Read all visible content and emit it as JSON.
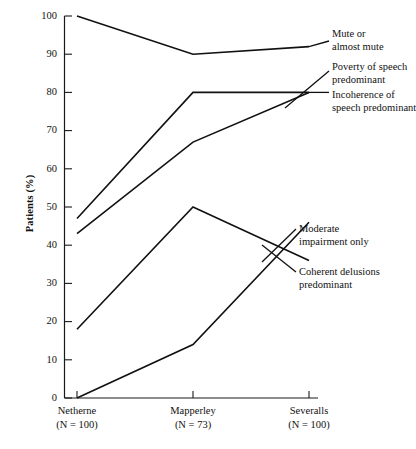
{
  "figure": {
    "y_axis_title": "Patients (%)",
    "y_ticks": [
      "0",
      "10",
      "20",
      "30",
      "40",
      "50",
      "60",
      "70",
      "80",
      "90",
      "100"
    ],
    "x_groups": [
      {
        "name": "Netherne",
        "n_text": "(N = 100)"
      },
      {
        "name": "Mapperley",
        "n_text": "(N = 73)"
      },
      {
        "name": "Severalls",
        "n_text": "(N = 100)"
      }
    ],
    "series_labels": [
      {
        "line1": "Mute or",
        "line2": "almost mute"
      },
      {
        "line1": "Poverty of speech",
        "line2": "predominant"
      },
      {
        "line1": "Incoherence of",
        "line2": "speech predominant"
      },
      {
        "line1": "Moderate",
        "line2": "impairment only"
      },
      {
        "line1": "Coherent delusions",
        "line2": "predominant"
      }
    ],
    "colors": {
      "line": "#111111",
      "axis": "#1a1a1a",
      "background": "#ffffff"
    }
  },
  "chart_data": {
    "type": "line",
    "title": "",
    "xlabel": "",
    "ylabel": "Patients (%)",
    "ylim": [
      0,
      100
    ],
    "yticks": [
      0,
      10,
      20,
      30,
      40,
      50,
      60,
      70,
      80,
      90,
      100
    ],
    "grid": false,
    "legend": "right-inline-labels",
    "categories": [
      "Netherne",
      "Mapperley",
      "Severalls"
    ],
    "category_n": [
      100,
      73,
      100
    ],
    "series": [
      {
        "name": "Mute or almost mute",
        "values": [
          100,
          90,
          92
        ]
      },
      {
        "name": "Poverty of speech predominant",
        "values": [
          47,
          80,
          80
        ]
      },
      {
        "name": "Incoherence of speech predominant",
        "values": [
          43,
          67,
          80
        ]
      },
      {
        "name": "Moderate impairment only",
        "values": [
          18,
          50,
          36
        ]
      },
      {
        "name": "Coherent delusions predominant",
        "values": [
          0,
          14,
          46
        ]
      }
    ]
  }
}
